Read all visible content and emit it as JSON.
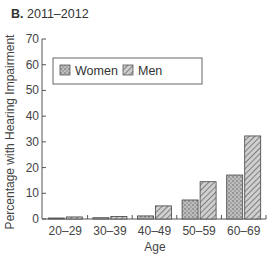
{
  "panel": {
    "letter": "B.",
    "period": "2011–2012"
  },
  "chart_data": {
    "type": "bar",
    "title": "2011–2012",
    "xlabel": "Age",
    "ylabel": "Percentage with Hearing Impairment",
    "ylim": [
      0,
      70
    ],
    "yticks": [
      0,
      10,
      20,
      30,
      40,
      50,
      60,
      70
    ],
    "categories": [
      "20–29",
      "30–39",
      "40–49",
      "50–59",
      "60–69"
    ],
    "series": [
      {
        "name": "Women",
        "pattern": "dotted",
        "color": "#bdbdbd",
        "values": [
          0.3,
          0.5,
          1.2,
          7.4,
          17.1
        ]
      },
      {
        "name": "Men",
        "pattern": "hatched",
        "color": "#c8c8c8",
        "values": [
          0.8,
          1.0,
          5.1,
          14.5,
          32.3
        ]
      }
    ],
    "legend": {
      "position": "top-left",
      "entries": [
        "Women",
        "Men"
      ]
    },
    "grid": false
  }
}
